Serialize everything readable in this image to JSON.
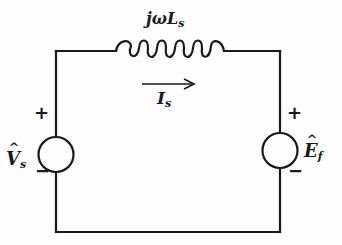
{
  "diagram": {
    "type": "circuit-schematic",
    "title": "",
    "colors": {
      "ink": "#1a1a1a",
      "background": "#fdfdfd"
    },
    "components": {
      "inductor": {
        "label_prefix": "jω",
        "label_main": "L",
        "label_sub": "s"
      },
      "current": {
        "label_main": "I",
        "label_sub": "s",
        "direction": "right"
      },
      "left_source": {
        "label_main": "V",
        "label_hat": "^",
        "label_sub": "s",
        "plus": "+",
        "minus": "−"
      },
      "right_source": {
        "label_main": "E",
        "label_hat": "^",
        "label_sub": "f",
        "plus": "+",
        "minus": "−"
      }
    }
  }
}
